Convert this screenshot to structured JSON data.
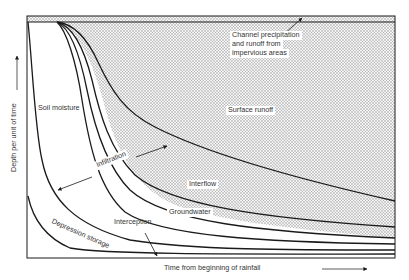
{
  "diagram": {
    "type": "hydrograph-components",
    "axes": {
      "x_label": "Time from beginning of rainfall",
      "y_label": "Depth per unit of time"
    },
    "regions": [
      {
        "id": "channel",
        "label_lines": [
          "Channel precipitation",
          "and runoff from",
          "impervious areas"
        ]
      },
      {
        "id": "surface_runoff",
        "label": "Surface runoff"
      },
      {
        "id": "soil_moisture",
        "label": "Soil moisture"
      },
      {
        "id": "infiltration",
        "label": "Infiltration"
      },
      {
        "id": "interflow",
        "label": "Interflow"
      },
      {
        "id": "groundwater",
        "label": "Groundwater"
      },
      {
        "id": "interception",
        "label": "Interception"
      },
      {
        "id": "depression_storage",
        "label": "Depression storage"
      }
    ],
    "colors": {
      "line": "#1a1a1a",
      "stipple_dot": "#8a8a8a",
      "text": "#333333",
      "background": "#ffffff"
    }
  }
}
